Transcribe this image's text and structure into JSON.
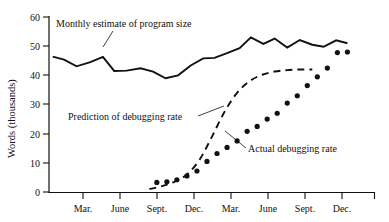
{
  "chart_data": {
    "type": "line",
    "title": "",
    "xlabel": "",
    "ylabel": "Words (thousands)",
    "ylim": [
      0,
      60
    ],
    "yticks": [
      0,
      10,
      20,
      30,
      40,
      50,
      60
    ],
    "ytick_labels": [
      "0",
      "10",
      "20",
      "30",
      "40",
      "50",
      "60"
    ],
    "xtick_labels": [
      "Mar.",
      "June",
      "Sept.",
      "Dec.",
      "Mar.",
      "June",
      "Sept.",
      "Dec."
    ],
    "xtick_months": [
      3,
      6,
      9,
      12,
      15,
      18,
      21,
      24
    ],
    "xlim_months": [
      0,
      26
    ],
    "grid": false,
    "legend_position": "inline-annotations",
    "series": [
      {
        "name": "Monthly estimate of program size",
        "style": "solid",
        "x": [
          0.3,
          1.2,
          2.2,
          3.3,
          4.3,
          5.2,
          6.2,
          7.3,
          8.3,
          9.3,
          10.3,
          11.3,
          12.3,
          13.2,
          14.2,
          15.2,
          16.1,
          17.1,
          18.0,
          19.0,
          20.0,
          21.0,
          21.9,
          22.9,
          23.8
        ],
        "y": [
          46.4,
          45.4,
          43.1,
          44.5,
          46.3,
          41.5,
          41.6,
          42.4,
          41.3,
          39.0,
          40.0,
          43.4,
          45.8,
          46.0,
          47.6,
          49.3,
          53.0,
          50.8,
          52.6,
          49.5,
          52.1,
          50.5,
          49.8,
          52.0,
          51.0
        ]
      },
      {
        "name": "Prediction of debugging rate",
        "style": "dashed",
        "x": [
          8.0,
          9.0,
          10.0,
          11.0,
          12.0,
          13.0,
          14.0,
          15.0,
          16.0,
          17.0,
          18.0,
          19.0,
          20.0,
          21.0
        ],
        "y": [
          1.0,
          2.0,
          3.5,
          6.0,
          11.0,
          19.0,
          27.5,
          34.0,
          38.0,
          40.2,
          41.3,
          41.8,
          42.0,
          42.0
        ]
      },
      {
        "name": "Actual debugging rate",
        "style": "dots",
        "x": [
          8.6,
          9.4,
          10.2,
          11.0,
          11.8,
          12.6,
          13.4,
          14.2,
          15.0,
          15.8,
          16.6,
          17.4,
          18.2,
          19.0,
          19.8,
          20.6,
          21.4,
          22.2,
          23.0,
          23.8
        ],
        "y": [
          3.3,
          3.5,
          4.2,
          5.5,
          7.2,
          10.5,
          13.2,
          15.3,
          17.5,
          20.8,
          22.5,
          25.0,
          27.0,
          30.5,
          33.0,
          36.5,
          39.5,
          42.5,
          47.8,
          48.0
        ]
      }
    ],
    "annotations": [
      {
        "text": "Monthly estimate of program size",
        "target_series": "Monthly estimate of program size"
      },
      {
        "text": "Prediction of debugging rate",
        "target_series": "Prediction of debugging rate"
      },
      {
        "text": "Actual debugging rate",
        "target_series": "Actual debugging rate"
      }
    ]
  },
  "axes": {
    "y_axis_title": "Words (thousands)",
    "y_ticks": [
      {
        "label": "60",
        "value": 60
      },
      {
        "label": "50",
        "value": 50
      },
      {
        "label": "40",
        "value": 40
      },
      {
        "label": "30",
        "value": 30
      },
      {
        "label": "20",
        "value": 20
      },
      {
        "label": "10",
        "value": 10
      },
      {
        "label": "0",
        "value": 0
      }
    ],
    "x_ticks": [
      {
        "label": "Mar.",
        "value": 3
      },
      {
        "label": "June",
        "value": 6
      },
      {
        "label": "Sept.",
        "value": 9
      },
      {
        "label": "Dec.",
        "value": 12
      },
      {
        "label": "Mar.",
        "value": 15
      },
      {
        "label": "June",
        "value": 18
      },
      {
        "label": "Sept.",
        "value": 21
      },
      {
        "label": "Dec.",
        "value": 24
      }
    ]
  },
  "labels": {
    "estimate": "Monthly estimate of program size",
    "prediction": "Prediction of debugging rate",
    "actual": "Actual debugging rate"
  },
  "colors": {
    "ink": "#111111",
    "background": "#ffffff"
  }
}
